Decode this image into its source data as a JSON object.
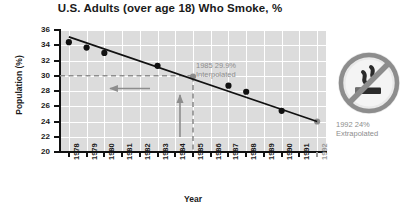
{
  "chart_data": {
    "type": "scatter",
    "title": "U.S. Adults (over age 18) Who Smoke, %",
    "xlabel": "Year",
    "ylabel": "Population (%)",
    "xlim": [
      1977.5,
      1992.5
    ],
    "ylim": [
      20,
      36
    ],
    "grid": true,
    "legend": "none",
    "x_ticks": [
      "1978",
      "1979",
      "1980",
      "1981",
      "1982",
      "1983",
      "1984",
      "1985",
      "1986",
      "1987",
      "1988",
      "1989",
      "1990",
      "1991",
      "1992"
    ],
    "y_ticks": [
      "20",
      "22",
      "24",
      "26",
      "28",
      "30",
      "32",
      "34",
      "36"
    ],
    "series": [
      {
        "name": "Measured data",
        "type": "scatter",
        "color": "#111111",
        "points": [
          {
            "x": 1978,
            "y": 34.4
          },
          {
            "x": 1979,
            "y": 33.7
          },
          {
            "x": 1980,
            "y": 33.0
          },
          {
            "x": 1983,
            "y": 31.3
          },
          {
            "x": 1987,
            "y": 28.7
          },
          {
            "x": 1988,
            "y": 27.9
          },
          {
            "x": 1990,
            "y": 25.4
          }
        ]
      },
      {
        "name": "Estimated points",
        "type": "scatter",
        "color": "#8d8d8d",
        "points": [
          {
            "x": 1985,
            "y": 29.9,
            "kind": "interpolated"
          },
          {
            "x": 1992,
            "y": 24.0,
            "kind": "extrapolated"
          }
        ]
      },
      {
        "name": "Best-fit trend line",
        "type": "line",
        "color": "#111111",
        "points": [
          {
            "x": 1978,
            "y": 35.1
          },
          {
            "x": 1992,
            "y": 24.0
          }
        ]
      }
    ],
    "annotations": [
      {
        "name": "interpolated",
        "line1": "1985 29.9%",
        "line2": "Interpolated",
        "x": 1985,
        "y": 29.9
      },
      {
        "name": "extrapolated",
        "line1": "1992 24%",
        "line2": "Extrapolated",
        "x": 1992,
        "y": 24.0
      }
    ],
    "guides": [
      {
        "name": "horizontal-guide",
        "orientation": "horizontal",
        "value": 30,
        "style": "dashed",
        "color": "#8d8d8d"
      },
      {
        "name": "vertical-guide",
        "orientation": "vertical",
        "value": 1985,
        "style": "dashed",
        "color": "#8d8d8d"
      }
    ],
    "arrows": [
      {
        "name": "read-left-arrow",
        "direction": "left"
      },
      {
        "name": "read-up-arrow",
        "direction": "up"
      }
    ]
  },
  "logo": {
    "name": "no-smoking-icon",
    "color": "#8d8d8d"
  }
}
